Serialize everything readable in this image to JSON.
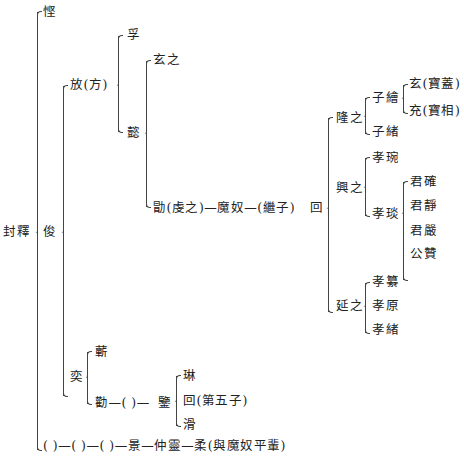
{
  "tree": {
    "root": "封釋",
    "gen1": {
      "a": "悭",
      "b": "俊",
      "c": "( )—( )—( )—景—仲靈—柔(與魔奴平輩)"
    },
    "fang": "放(方)",
    "fang_children": {
      "a": "孚",
      "b": "懿"
    },
    "yi_children": {
      "a": "玄之",
      "b": "勖(虔之)—魔奴—(繼子)"
    },
    "hui": "回",
    "hui_children": {
      "long": "隆之",
      "xing": "興之",
      "yan": "延之"
    },
    "long_children": {
      "a": "子繪",
      "b": "子緒"
    },
    "zihui_children": {
      "a": "玄(寶蓋)",
      "b": "充(寶相)"
    },
    "xing_children": {
      "a": "孝琬",
      "b": "孝琰"
    },
    "xiaoyan_children": {
      "a": "君確",
      "b": "君靜",
      "c": "君嚴",
      "d": "公贊"
    },
    "yan_children": {
      "a": "孝纂",
      "b": "孝原",
      "c": "孝緒"
    },
    "yi2": "奕",
    "yi2_children": {
      "a": "蘄",
      "b": "勸—( )—"
    },
    "jian": "鑒",
    "jian_children": {
      "a": "琳",
      "b": "回(第五子)",
      "c": "滑"
    }
  }
}
